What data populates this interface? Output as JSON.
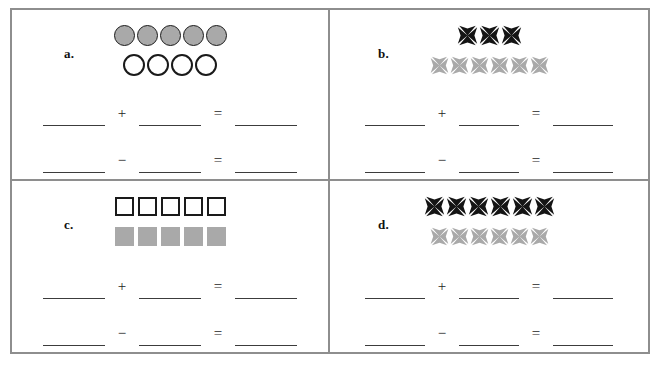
{
  "worksheet": {
    "border_color": "#8e8e8e",
    "fill_gray": "#a9a9a9",
    "fill_black": "#141414",
    "outline_color": "#1a1a1a",
    "line_color": "#3c3c3c"
  },
  "operators": {
    "plus": "+",
    "minus": "−",
    "equals": "="
  },
  "blank_value": "",
  "panels": [
    {
      "id": "a",
      "label": "a.",
      "shape": "circle",
      "top_row": {
        "count": 5,
        "style": "filled",
        "icon_name": "gray-circle-icon"
      },
      "bottom_row": {
        "count": 4,
        "style": "open",
        "icon_name": "white-circle-icon"
      },
      "equations": [
        {
          "name": "addition",
          "operator": "+",
          "blanks": [
            "",
            "",
            ""
          ]
        },
        {
          "name": "subtraction",
          "operator": "−",
          "blanks": [
            "",
            "",
            ""
          ]
        }
      ]
    },
    {
      "id": "b",
      "label": "b.",
      "shape": "pinwheel",
      "top_row": {
        "count": 3,
        "style": "black",
        "icon_name": "black-pinwheel-icon"
      },
      "bottom_row": {
        "count": 6,
        "style": "gray",
        "icon_name": "gray-pinwheel-icon"
      },
      "equations": [
        {
          "name": "addition",
          "operator": "+",
          "blanks": [
            "",
            "",
            ""
          ]
        },
        {
          "name": "subtraction",
          "operator": "−",
          "blanks": [
            "",
            "",
            ""
          ]
        }
      ]
    },
    {
      "id": "c",
      "label": "c.",
      "shape": "square",
      "top_row": {
        "count": 5,
        "style": "open",
        "icon_name": "white-square-icon"
      },
      "bottom_row": {
        "count": 5,
        "style": "filled",
        "icon_name": "gray-square-icon"
      },
      "equations": [
        {
          "name": "addition",
          "operator": "+",
          "blanks": [
            "",
            "",
            ""
          ]
        },
        {
          "name": "subtraction",
          "operator": "−",
          "blanks": [
            "",
            "",
            ""
          ]
        }
      ]
    },
    {
      "id": "d",
      "label": "d.",
      "shape": "pinwheel",
      "top_row": {
        "count": 6,
        "style": "black",
        "icon_name": "black-pinwheel-icon"
      },
      "bottom_row": {
        "count": 6,
        "style": "gray",
        "icon_name": "gray-pinwheel-icon"
      },
      "equations": [
        {
          "name": "addition",
          "operator": "+",
          "blanks": [
            "",
            "",
            ""
          ]
        },
        {
          "name": "subtraction",
          "operator": "−",
          "blanks": [
            "",
            "",
            ""
          ]
        }
      ]
    }
  ]
}
